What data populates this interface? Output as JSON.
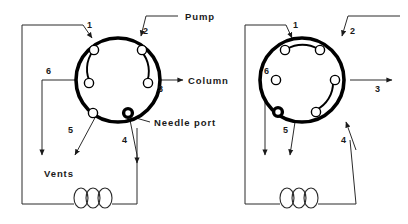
{
  "figure": {
    "type": "diagram",
    "background_color": "#ffffff",
    "line_color": "#2b2b2b",
    "body_color": "#000000"
  },
  "labels": {
    "pump": "Pump",
    "column": "Column",
    "needle_port": "Needle port",
    "vents": "Vents"
  },
  "ports": {
    "p1": "1",
    "p2": "2",
    "p3": "3",
    "p4": "4",
    "p5": "5",
    "p6": "6"
  },
  "valves": [
    {
      "name": "left-valve",
      "state": "load",
      "center_x": 118,
      "center_y": 80,
      "radius": 52,
      "rotor_connections": [
        {
          "from": "1",
          "to": "6"
        },
        {
          "from": "2",
          "to": "3"
        }
      ],
      "port_numbers": [
        "1",
        "2",
        "3",
        "4",
        "5",
        "6"
      ],
      "needle_port_marker": true,
      "external_labels": [
        "Pump",
        "Column",
        "Needle port",
        "Vents"
      ],
      "loop_turns": 3
    },
    {
      "name": "right-valve",
      "state": "inject",
      "center_x": 302,
      "center_y": 80,
      "radius": 52,
      "rotor_connections": [
        {
          "from": "1",
          "to": "2"
        },
        {
          "from": "3",
          "to": "4"
        }
      ],
      "port_numbers": [
        "1",
        "2",
        "3",
        "4",
        "5",
        "6"
      ],
      "needle_port_marker": true,
      "external_labels": [],
      "loop_turns": 3
    }
  ],
  "flow": {
    "pump_inlet_port": "2",
    "column_outlet_port": "3",
    "vent_ports": [
      "5",
      "6"
    ],
    "sample_loop_ports": [
      "1",
      "4"
    ]
  }
}
